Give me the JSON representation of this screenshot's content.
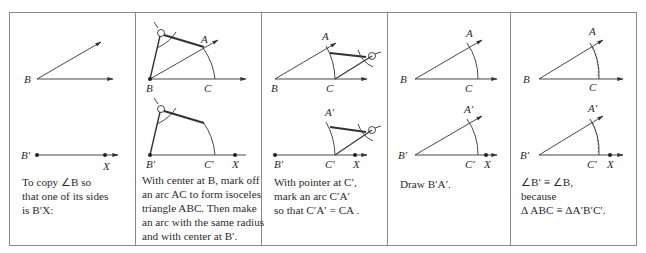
{
  "figure": {
    "panels": [
      {
        "id": "step-1",
        "labels": {
          "top_vertex": "B",
          "bottom_vertex": "B′",
          "bottom_point": "X"
        },
        "caption": [
          "To copy ∠B so",
          "that one of its sides",
          "is B′X:"
        ]
      },
      {
        "id": "step-2",
        "labels": {
          "A": "A",
          "B": "B",
          "C": "C",
          "B_prime": "B′",
          "C_prime": "C′",
          "X": "X"
        },
        "caption": [
          "With center at B, mark off",
          "an arc AC to form isoceles",
          "triangle ABC. Then make",
          "an arc with the same radius",
          "and with center at B′."
        ]
      },
      {
        "id": "step-3",
        "labels": {
          "A": "A",
          "B": "B",
          "C": "C",
          "A_prime": "A′",
          "B_prime": "B′",
          "C_prime": "C′",
          "X": "X"
        },
        "caption": [
          "With pointer at C′,",
          "mark an arc C′A′",
          "so that  C′A′ = CA ."
        ]
      },
      {
        "id": "step-4",
        "labels": {
          "A": "A",
          "B": "B",
          "C": "C",
          "A_prime": "A′",
          "B_prime": "B′",
          "C_prime": "C′",
          "X": "X"
        },
        "caption": [
          "Draw B′A′."
        ]
      },
      {
        "id": "step-5",
        "labels": {
          "A": "A",
          "B": "B",
          "C": "C",
          "A_prime": "A′",
          "B_prime": "B′",
          "C_prime": "C′",
          "X": "X"
        },
        "caption": [
          "∠B′ ≡ ∠B,",
          "because",
          "Δ ABC  ≡ ΔA′B′C′."
        ]
      }
    ]
  }
}
